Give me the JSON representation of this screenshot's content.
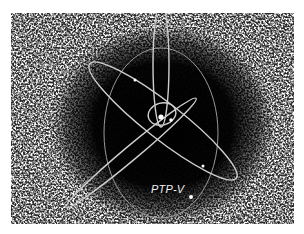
{
  "figure": {
    "label": "PTP-V",
    "colors": {
      "background": "#ffffff",
      "noise_light": "#d8d8d8",
      "void": "#000000",
      "orbit": "#cfcfcf",
      "dot": "#ffffff"
    }
  }
}
